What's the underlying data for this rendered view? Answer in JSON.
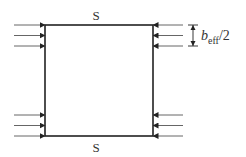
{
  "diagram": {
    "top_label": "S",
    "bottom_label": "S",
    "dimension_label": {
      "base": "b",
      "subscript": "eff",
      "suffix": "/2"
    },
    "colors": {
      "stroke": "#222222",
      "arrow": "#555555",
      "background": "#ffffff"
    },
    "left_arrows_direction": "right",
    "right_arrows_direction": "left",
    "arrow_groups": [
      {
        "side": "left",
        "position": "top",
        "count": 3
      },
      {
        "side": "left",
        "position": "bottom",
        "count": 3
      },
      {
        "side": "right",
        "position": "top",
        "count": 3
      },
      {
        "side": "right",
        "position": "bottom",
        "count": 3
      }
    ]
  }
}
